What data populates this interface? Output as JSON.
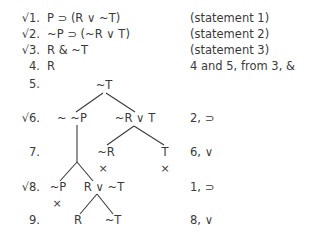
{
  "proof": {
    "lines": [
      {
        "num": "√1.",
        "formula": "P ⊃ (R ∨ ~T)",
        "justification": "(statement 1)",
        "checked": true
      },
      {
        "num": "√2.",
        "formula": "~P ⊃ (~R ∨ T)",
        "justification": "(statement 2)",
        "checked": true
      },
      {
        "num": "√3.",
        "formula": "R & ~T",
        "justification": "(statement 3)",
        "checked": true
      },
      {
        "num": "4.",
        "formula": "R",
        "justification": "4 and 5, from 3, &",
        "checked": false
      },
      {
        "num": "5.",
        "justification": ""
      },
      {
        "num": "√6.",
        "justification": "2, ⊃",
        "checked": true
      },
      {
        "num": "7.",
        "justification": "6, ∨"
      },
      {
        "num": "√8.",
        "justification": "1, ⊃",
        "checked": true
      },
      {
        "num": "9.",
        "justification": "8, ∨"
      }
    ],
    "tree": {
      "line5": {
        "node": "~T"
      },
      "line6": {
        "left": "~ ~P",
        "right": "~R ∨ T"
      },
      "line7": {
        "left": "~R",
        "right": "T",
        "left_close": "×",
        "right_close": "×"
      },
      "line8": {
        "left": "~P",
        "right": "R ∨ ~T",
        "left_close": "×"
      },
      "line9": {
        "left": "R",
        "right": "~T"
      }
    }
  }
}
